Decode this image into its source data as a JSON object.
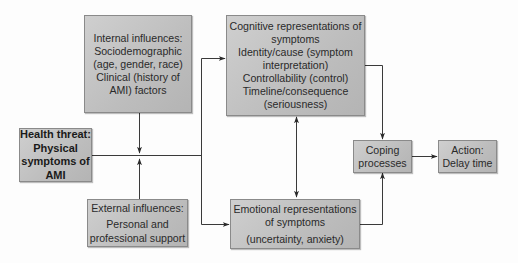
{
  "diagram": {
    "type": "flowchart",
    "nodes": {
      "internal": {
        "lines": [
          "Internal influences:",
          "Sociodemographic",
          "(age, gender, race)",
          "Clinical (history of",
          "AMI) factors"
        ]
      },
      "health_threat": {
        "lines": [
          "Health threat:",
          "Physical",
          "symptoms of",
          "AMI"
        ]
      },
      "external": {
        "lines": [
          "External influences:",
          "Personal and",
          "professional support"
        ]
      },
      "cognitive": {
        "lines": [
          "Cognitive representations of",
          "symptoms",
          "Identity/cause (symptom",
          "interpretation)",
          "Controllability (control)",
          "Timeline/consequence",
          "(seriousness)"
        ]
      },
      "emotional": {
        "lines": [
          "Emotional representations",
          "of symptoms",
          "(uncertainty, anxiety)"
        ]
      },
      "coping": {
        "lines": [
          "Coping",
          "processes"
        ]
      },
      "action": {
        "lines": [
          "Action:",
          "Delay time"
        ]
      }
    },
    "edges": [
      {
        "from": "internal",
        "to": "health_threat-line",
        "style": "arrow"
      },
      {
        "from": "external",
        "to": "health_threat-line",
        "style": "arrow"
      },
      {
        "from": "health_threat",
        "to": "cognitive",
        "style": "arrow"
      },
      {
        "from": "health_threat",
        "to": "emotional",
        "style": "arrow"
      },
      {
        "from": "cognitive",
        "to": "emotional",
        "style": "bidirectional"
      },
      {
        "from": "cognitive",
        "to": "coping",
        "style": "arrow"
      },
      {
        "from": "emotional",
        "to": "coping",
        "style": "arrow"
      },
      {
        "from": "coping",
        "to": "action",
        "style": "arrow"
      }
    ],
    "colors": {
      "box_fill": "#c2c2c2",
      "box_border": "#8a8a8a",
      "line": "#3a3a3a",
      "text": "#2a2a2a"
    }
  }
}
